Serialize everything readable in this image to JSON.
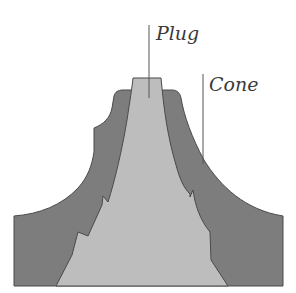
{
  "diagram": {
    "title": "",
    "labels": {
      "plug": "Plug",
      "cone": "Cone"
    },
    "colors": {
      "cone_fill": "#7d7d7d",
      "plug_fill": "#bdbdbd",
      "outline": "#4a4a4a",
      "leader_line": "#555555",
      "background": "#ffffff"
    }
  }
}
